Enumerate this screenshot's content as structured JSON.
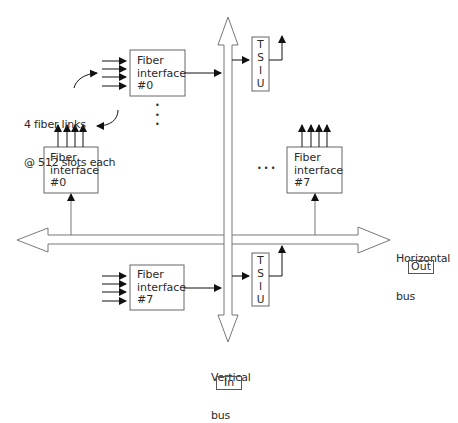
{
  "diagram": {
    "fiber_links_note": {
      "line1": "4 fiber links",
      "line2": "@ 512 slots each"
    },
    "fiber_interfaces": [
      {
        "id": "top-0",
        "line1": "Fiber",
        "line2": "interface",
        "line3": "#0"
      },
      {
        "id": "left-0",
        "line1": "Fiber",
        "line2": "interface",
        "line3": "#0"
      },
      {
        "id": "right-7",
        "line1": "Fiber",
        "line2": "interface",
        "line3": "#7"
      },
      {
        "id": "bottom-7",
        "line1": "Fiber",
        "line2": "interface",
        "line3": "#7"
      }
    ],
    "tsiu_blocks": [
      {
        "id": "tsiu-top",
        "letters": [
          "T",
          "S",
          "I",
          "U"
        ]
      },
      {
        "id": "tsiu-bottom",
        "letters": [
          "T",
          "S",
          "I",
          "U"
        ]
      }
    ],
    "horizontal_bus": {
      "line1": "Horizontal",
      "line2": "bus",
      "tag": "Out"
    },
    "vertical_bus": {
      "line1": "Vertical",
      "line2": "bus",
      "tag": "In"
    },
    "ellipsis_vertical": "•\n•\n•",
    "ellipsis_horizontal": "• • •"
  }
}
